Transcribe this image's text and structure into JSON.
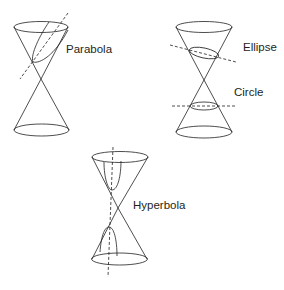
{
  "line_color": "#231f20",
  "diagrams": [
    {
      "id": "parabola",
      "label": "Parabola"
    },
    {
      "id": "ellipse-circle",
      "labels": [
        "Ellipse",
        "Circle"
      ]
    },
    {
      "id": "hyperbola",
      "label": "Hyperbola"
    }
  ]
}
